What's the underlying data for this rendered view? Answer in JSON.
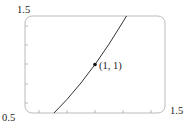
{
  "chart_data": {
    "type": "line",
    "title": "",
    "xlabel": "",
    "ylabel": "",
    "xlim": [
      0.5,
      1.5
    ],
    "ylim": [
      0.5,
      1.5
    ],
    "grid": false,
    "legend": null,
    "tick_labels": {
      "x_left": "0.5",
      "x_right": "1.5",
      "y_top": "1.5"
    },
    "series": [
      {
        "name": "y = x^2",
        "x": [
          0.707,
          0.8,
          0.9,
          1.0,
          1.1,
          1.2,
          1.225
        ],
        "y": [
          0.5,
          0.64,
          0.81,
          1.0,
          1.21,
          1.44,
          1.5
        ]
      }
    ],
    "points": [
      {
        "x": 1,
        "y": 1,
        "label": "(1, 1)"
      }
    ],
    "annotations": [
      "(1, 1)"
    ]
  },
  "colors": {
    "curve": "#333333",
    "frame": "#bbbbbb",
    "point": "#111111"
  }
}
